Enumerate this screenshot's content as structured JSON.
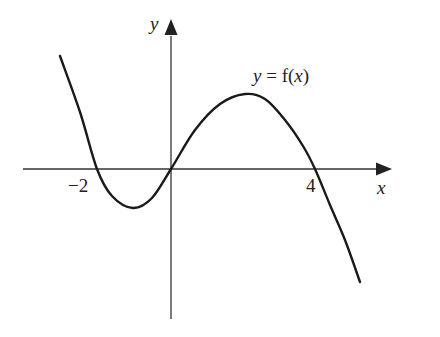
{
  "chart_data": {
    "type": "line",
    "title": "",
    "xlabel": "x",
    "ylabel": "y",
    "curve_label": "y = f(x)",
    "x_ticks": [
      {
        "value": -2,
        "label": "−2"
      },
      {
        "value": 4,
        "label": "4"
      }
    ],
    "roots": [
      -2,
      0,
      4
    ],
    "passes_through_origin": true,
    "shape": "cubic with negative leading coefficient: f(x) = -k·x(x+2)(x-4)",
    "local_minimum": {
      "x": -1.0,
      "approx_y": "negative"
    },
    "local_maximum": {
      "x": 2.0,
      "approx_y": "positive"
    },
    "series": [
      {
        "name": "y = f(x)",
        "x": [
          -3.0,
          -2.5,
          -2.0,
          -1.5,
          -1.0,
          -0.5,
          0.0,
          0.5,
          1.0,
          1.5,
          2.0,
          2.5,
          3.0,
          3.5,
          4.0,
          4.5,
          5.0
        ],
        "y": [
          3.1,
          1.3,
          0.0,
          -0.7,
          -1.0,
          -0.8,
          0.0,
          1.1,
          1.9,
          2.4,
          2.5,
          2.3,
          1.8,
          1.1,
          0.0,
          -1.3,
          -3.0
        ]
      }
    ],
    "grid": false,
    "legend": "none",
    "axes": "arrowed x and y axes crossing at origin"
  },
  "labels": {
    "y_axis": "y",
    "x_axis": "x",
    "curve_y": "y",
    "curve_eq": " = f(",
    "curve_x": "x",
    "curve_close": ")",
    "tick_neg2": "−2",
    "tick_4": "4"
  },
  "colors": {
    "axis": "#333333",
    "curve": "#1a1a1a",
    "background": "#ffffff"
  }
}
